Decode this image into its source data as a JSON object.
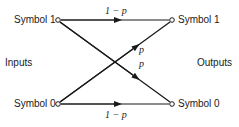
{
  "diagram": {
    "type": "binary-symmetric-channel",
    "inputs_label": "Inputs",
    "outputs_label": "Outputs",
    "nodes": {
      "input_top": "Symbol 1",
      "input_bottom": "Symbol 0",
      "output_top": "Symbol 1",
      "output_bottom": "Symbol 0"
    },
    "edges": {
      "top_straight": "1 − p",
      "bottom_straight": "1 − p",
      "cross_up": "p",
      "cross_down": "p"
    },
    "colors": {
      "line": "#1a1a1a",
      "background": "#ffffff"
    }
  }
}
